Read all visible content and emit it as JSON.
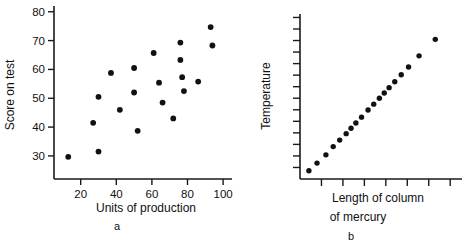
{
  "figure": {
    "panels": [
      {
        "caption": "a",
        "xlabel": "Units of production",
        "ylabel": "Score on test"
      },
      {
        "caption": "b",
        "xlabel_line1": "Length of column",
        "xlabel_line2": "of mercury",
        "ylabel": "Temperature"
      }
    ]
  },
  "chart_data": [
    {
      "type": "scatter",
      "title": "",
      "panel_label": "a",
      "xlabel": "Units of production",
      "ylabel": "Score on test",
      "xlim": [
        5,
        105
      ],
      "ylim": [
        22,
        82
      ],
      "xticks": [
        20,
        40,
        60,
        80,
        100
      ],
      "yticks": [
        30,
        40,
        50,
        60,
        70,
        80
      ],
      "grid": false,
      "legend": "none",
      "marker": "filled-circle",
      "marker_color": "#111111",
      "points": [
        {
          "x": 13,
          "y": 29.7
        },
        {
          "x": 27,
          "y": 41.5
        },
        {
          "x": 30,
          "y": 50.5
        },
        {
          "x": 30,
          "y": 31.5
        },
        {
          "x": 37,
          "y": 58.8
        },
        {
          "x": 42,
          "y": 46.0
        },
        {
          "x": 50,
          "y": 60.5
        },
        {
          "x": 50,
          "y": 52.0
        },
        {
          "x": 52,
          "y": 38.7
        },
        {
          "x": 61,
          "y": 65.7
        },
        {
          "x": 64,
          "y": 55.4
        },
        {
          "x": 66,
          "y": 48.5
        },
        {
          "x": 72,
          "y": 43.0
        },
        {
          "x": 76,
          "y": 69.3
        },
        {
          "x": 76,
          "y": 63.3
        },
        {
          "x": 77,
          "y": 57.3
        },
        {
          "x": 78,
          "y": 52.5
        },
        {
          "x": 86,
          "y": 55.8
        },
        {
          "x": 93,
          "y": 74.7
        },
        {
          "x": 94,
          "y": 68.3
        }
      ]
    },
    {
      "type": "scatter",
      "title": "",
      "panel_label": "b",
      "xlabel": "Length of column of mercury",
      "ylabel": "Temperature",
      "xlim": [
        0,
        10
      ],
      "ylim": [
        0,
        14
      ],
      "xticks_count": 7,
      "yticks_count": 14,
      "xtick_labels": [],
      "ytick_labels": [],
      "grid": false,
      "legend": "none",
      "marker": "filled-circle",
      "marker_color": "#111111",
      "points": [
        {
          "x": 0.55,
          "y": 0.7
        },
        {
          "x": 1.05,
          "y": 1.35
        },
        {
          "x": 1.6,
          "y": 2.05
        },
        {
          "x": 2.05,
          "y": 2.75
        },
        {
          "x": 2.45,
          "y": 3.3
        },
        {
          "x": 2.85,
          "y": 3.85
        },
        {
          "x": 3.15,
          "y": 4.3
        },
        {
          "x": 3.45,
          "y": 4.75
        },
        {
          "x": 3.8,
          "y": 5.25
        },
        {
          "x": 4.2,
          "y": 5.85
        },
        {
          "x": 4.55,
          "y": 6.35
        },
        {
          "x": 4.9,
          "y": 6.85
        },
        {
          "x": 5.2,
          "y": 7.3
        },
        {
          "x": 5.5,
          "y": 7.75
        },
        {
          "x": 5.85,
          "y": 8.25
        },
        {
          "x": 6.25,
          "y": 8.85
        },
        {
          "x": 6.7,
          "y": 9.5
        },
        {
          "x": 7.35,
          "y": 10.45
        },
        {
          "x": 8.35,
          "y": 11.85
        }
      ]
    }
  ]
}
